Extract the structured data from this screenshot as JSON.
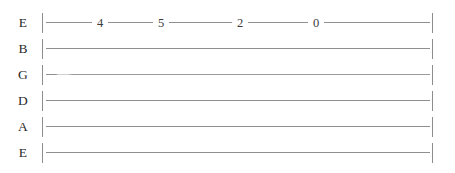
{
  "sheet": {
    "type": "guitar-tablature",
    "width": 455,
    "height": 173,
    "background_color": "#ffffff",
    "line_color": "#8f8f8f",
    "text_color": "#2b2b2b",
    "tuning": "E A D G B E",
    "measure_start_bar": "|",
    "measure_end_bar": "|"
  },
  "strings": [
    {
      "label": "E",
      "string_number": 1,
      "top": 10,
      "faint": false,
      "notes": [
        {
          "fret": "4",
          "x": 100
        },
        {
          "fret": "5",
          "x": 161
        },
        {
          "fret": "2",
          "x": 240
        },
        {
          "fret": "0",
          "x": 316
        }
      ]
    },
    {
      "label": "B",
      "string_number": 2,
      "top": 36,
      "faint": false,
      "notes": []
    },
    {
      "label": "G",
      "string_number": 3,
      "top": 62,
      "faint": true,
      "notes": []
    },
    {
      "label": "D",
      "string_number": 4,
      "top": 88,
      "faint": false,
      "notes": []
    },
    {
      "label": "A",
      "string_number": 5,
      "top": 114,
      "faint": false,
      "notes": []
    },
    {
      "label": "E",
      "string_number": 6,
      "top": 140,
      "faint": false,
      "notes": []
    }
  ]
}
